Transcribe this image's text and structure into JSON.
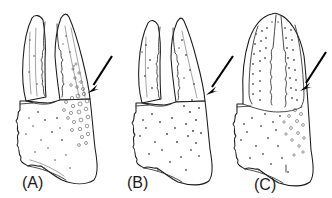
{
  "figure": {
    "type": "scientific-line-drawing",
    "background_color": "#ffffff",
    "ink_color": "#1a1a1a",
    "arrow_color": "#000000",
    "panel_count": 3,
    "panels": [
      {
        "id": "A",
        "label": "(A)",
        "label_x": 22,
        "label_y": 188,
        "description": "chela with two gaping toothed fingers, heavily granulated outer palm margin",
        "fingers_open": true,
        "arrow": {
          "name": "annotation-arrow-a",
          "tail_x": 112,
          "tail_y": 56,
          "tip_x": 89,
          "tip_y": 92,
          "angle_deg": 57,
          "points_to": "granulate outer margin of propodus"
        }
      },
      {
        "id": "B",
        "label": "(B)",
        "label_x": 127,
        "label_y": 188,
        "description": "chela with two gaping toothed fingers, sparsely punctate palm",
        "fingers_open": true,
        "arrow": {
          "name": "annotation-arrow-b",
          "tail_x": 233,
          "tail_y": 56,
          "tip_x": 207,
          "tip_y": 94,
          "angle_deg": 56,
          "points_to": "smooth outer margin of propodus"
        }
      },
      {
        "id": "C",
        "label": "(C)",
        "label_x": 254,
        "label_y": 190,
        "description": "chela with closed fingers forming blunt rounded tip, dotted longitudinal rows",
        "fingers_open": false,
        "arrow": {
          "name": "annotation-arrow-c",
          "tail_x": 326,
          "tail_y": 52,
          "tip_x": 301,
          "tip_y": 90,
          "angle_deg": 56,
          "points_to": "granulate outer margin of propodus"
        }
      }
    ]
  }
}
